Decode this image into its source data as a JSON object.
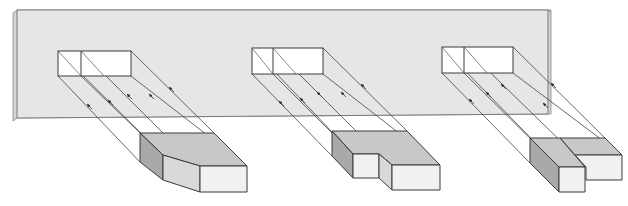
{
  "plane": {
    "label": "投影面",
    "fill": "#e6e6e6",
    "edge": "#7a7a7a"
  },
  "colors": {
    "line": "#3a3a3a",
    "projector": "#444444",
    "top_face": "#c8c8c8",
    "side_face": "#a9a9a9",
    "front_face": "#f1f1f1",
    "slant_face": "#d9d9d9",
    "projection_fill": "#ffffff"
  },
  "figures": [
    {
      "id": "figure-1",
      "description": "Solid with slanted front-left face projected onto plane",
      "projection": {
        "x": 58,
        "y": 51,
        "w": 73,
        "h": 25,
        "divider_x": 81
      },
      "arrows": 5
    },
    {
      "id": "figure-2",
      "description": "Stepped solid (short left block, longer right block) projected onto plane",
      "projection": {
        "x": 252,
        "y": 48,
        "w": 71,
        "h": 26,
        "divider_x": 273
      },
      "arrows": 5
    },
    {
      "id": "figure-3",
      "description": "Stepped solid (longer left block, shorter right block) projected onto plane",
      "projection": {
        "x": 442,
        "y": 47,
        "w": 71,
        "h": 26,
        "divider_x": 464
      },
      "arrows": 5
    }
  ]
}
